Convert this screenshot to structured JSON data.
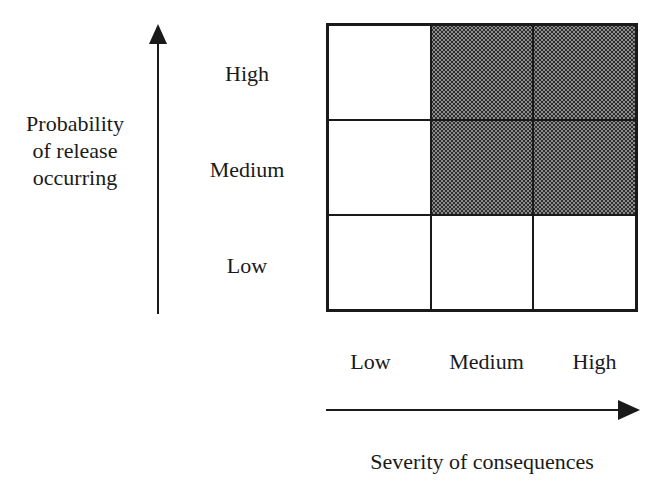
{
  "y_axis": {
    "title_lines": [
      "Probability",
      "of release",
      "occurring"
    ],
    "levels": [
      "High",
      "Medium",
      "Low"
    ]
  },
  "x_axis": {
    "title": "Severity of consequences",
    "levels": [
      "Low",
      "Medium",
      "High"
    ]
  },
  "matrix": {
    "rows": [
      "High",
      "Medium",
      "Low"
    ],
    "cols": [
      "Low",
      "Medium",
      "High"
    ],
    "shaded": [
      [
        false,
        true,
        true
      ],
      [
        false,
        true,
        true
      ],
      [
        false,
        false,
        false
      ]
    ],
    "shade_color": "#8c8c8c",
    "line_color": "#1a1a1a"
  }
}
